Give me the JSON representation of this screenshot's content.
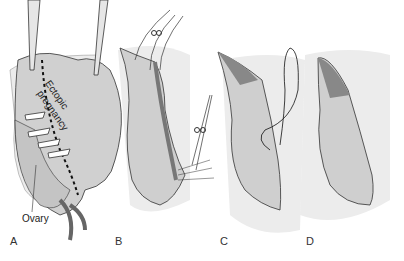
{
  "figure": {
    "panels": [
      {
        "id": "A",
        "label": "A",
        "annotations": [
          "Ectopic pregnancy",
          "Ovary"
        ]
      },
      {
        "id": "B",
        "label": "B"
      },
      {
        "id": "C",
        "label": "C"
      },
      {
        "id": "D",
        "label": "D"
      }
    ],
    "annotations": {
      "ectopic_line1": "Ectopic",
      "ectopic_line2": "pregnancy",
      "ovary": "Ovary"
    },
    "colors": {
      "tissue_fill": "#cfcfcf",
      "tube_dark": "#8a8a8a",
      "background_tissue": "#ececec",
      "outline": "#333333"
    }
  }
}
